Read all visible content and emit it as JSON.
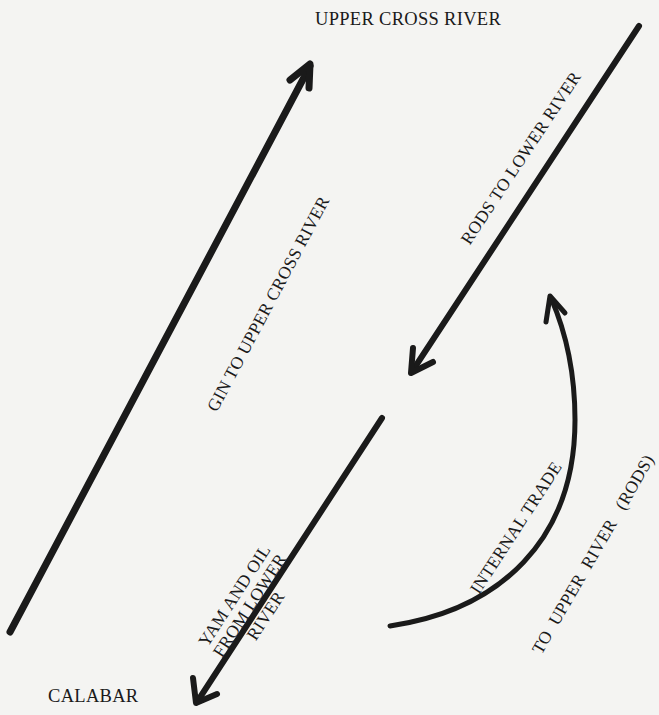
{
  "places": {
    "top": "UPPER CROSS RIVER",
    "bottom": "CALABAR"
  },
  "flows": [
    {
      "id": "gin",
      "label": "GIN TO UPPER CROSS RIVER",
      "direction": "to upper cross river"
    },
    {
      "id": "rods",
      "label": "RODS TO LOWER RIVER",
      "direction": "to calabar side / lower river"
    },
    {
      "id": "yam_oil",
      "label_lines": [
        "YAM AND OIL",
        "FROM LOWER",
        "RIVER"
      ],
      "direction": "to calabar"
    },
    {
      "id": "internal",
      "label_inner": "INTERNAL TRADE",
      "label_outer": "TO  UPPER  RIVER   (RODS)",
      "direction": "upward"
    }
  ],
  "colors": {
    "ink": "#1a1a1a",
    "paper": "#f4f4f2"
  }
}
